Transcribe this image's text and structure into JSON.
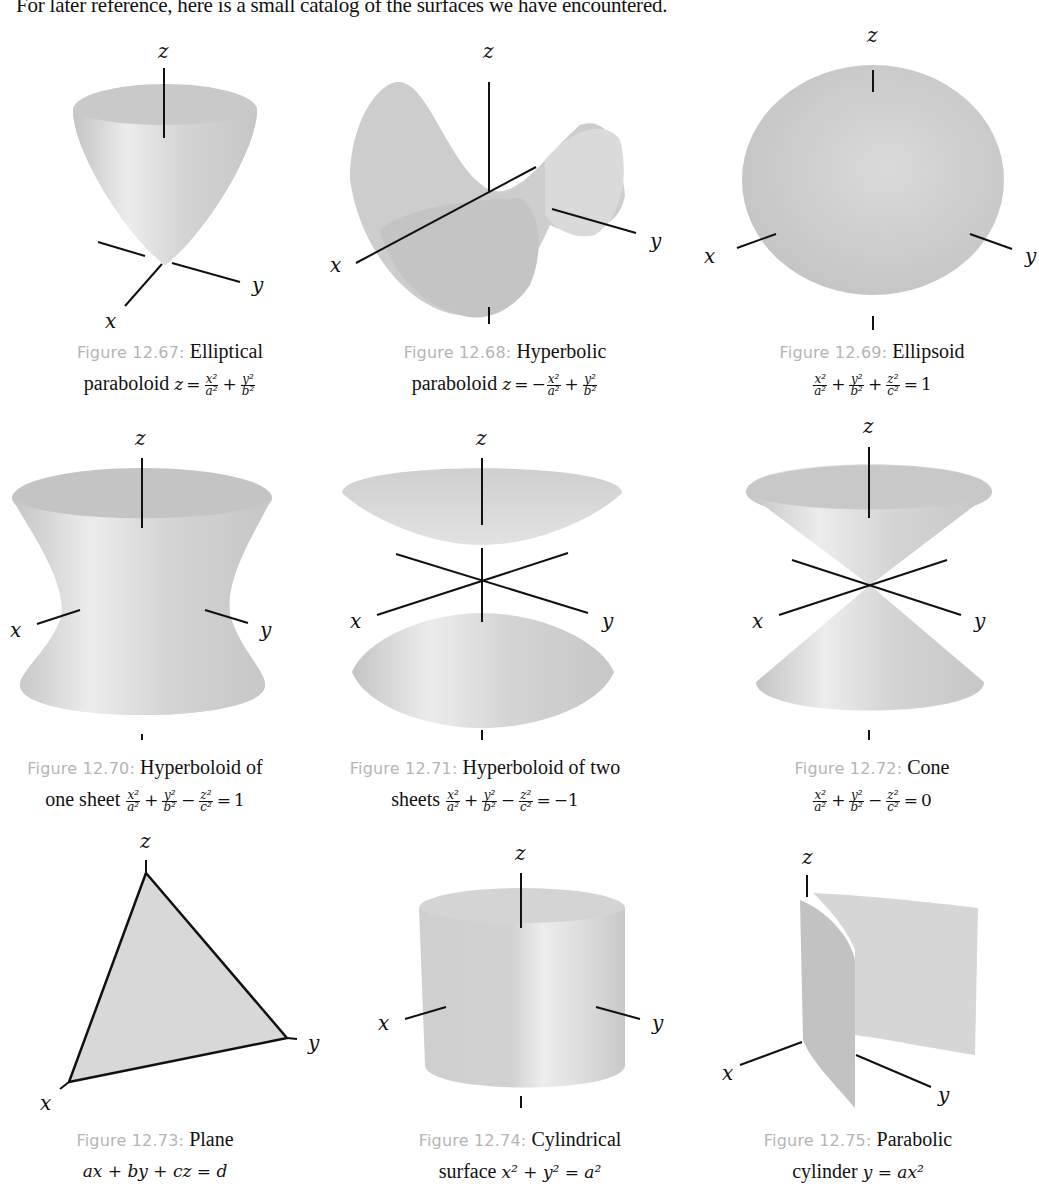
{
  "intro_text": "For later reference, here is a small catalog of the surfaces we have encountered.",
  "axis_labels": {
    "x": "x",
    "y": "y",
    "z": "z"
  },
  "figures": [
    {
      "label": "Figure 12.67:",
      "title": "Elliptical",
      "line2_prefix": "paraboloid",
      "equation": "z = x^2/a^2 + y^2/b^2",
      "eq_parts": {
        "lhs": "z",
        "eq": "=",
        "t1n": "x²",
        "t1d": "a²",
        "op1": "+",
        "t2n": "y²",
        "t2d": "b²"
      }
    },
    {
      "label": "Figure 12.68:",
      "title": "Hyperbolic",
      "line2_prefix": "paraboloid",
      "equation": "z = -x^2/a^2 + y^2/b^2",
      "eq_parts": {
        "lhs": "z",
        "eq": "=",
        "neg": "−",
        "t1n": "x²",
        "t1d": "a²",
        "op1": "+",
        "t2n": "y²",
        "t2d": "b²"
      }
    },
    {
      "label": "Figure 12.69:",
      "title": "Ellipsoid",
      "line2_prefix": "",
      "equation": "x^2/a^2 + y^2/b^2 + z^2/c^2 = 1",
      "eq_parts": {
        "t1n": "x²",
        "t1d": "a²",
        "op1": "+",
        "t2n": "y²",
        "t2d": "b²",
        "op2": "+",
        "t3n": "z²",
        "t3d": "c²",
        "eq": "=",
        "rhs": "1"
      }
    },
    {
      "label": "Figure 12.70:",
      "title": "Hyperboloid of",
      "line2_prefix": "one sheet",
      "equation": "x^2/a^2 + y^2/b^2 - z^2/c^2 = 1",
      "eq_parts": {
        "t1n": "x²",
        "t1d": "a²",
        "op1": "+",
        "t2n": "y²",
        "t2d": "b²",
        "op2": "−",
        "t3n": "z²",
        "t3d": "c²",
        "eq": "=",
        "rhs": "1"
      }
    },
    {
      "label": "Figure 12.71:",
      "title": "Hyperboloid of two",
      "line2_prefix": "sheets",
      "equation": "x^2/a^2 + y^2/b^2 - z^2/c^2 = -1",
      "eq_parts": {
        "t1n": "x²",
        "t1d": "a²",
        "op1": "+",
        "t2n": "y²",
        "t2d": "b²",
        "op2": "−",
        "t3n": "z²",
        "t3d": "c²",
        "eq": "=",
        "rhs": "−1"
      }
    },
    {
      "label": "Figure 12.72:",
      "title": "Cone",
      "line2_prefix": "",
      "equation": "x^2/a^2 + y^2/b^2 - z^2/c^2 = 0",
      "eq_parts": {
        "t1n": "x²",
        "t1d": "a²",
        "op1": "+",
        "t2n": "y²",
        "t2d": "b²",
        "op2": "−",
        "t3n": "z²",
        "t3d": "c²",
        "eq": "=",
        "rhs": "0"
      }
    },
    {
      "label": "Figure 12.73:",
      "title": "Plane",
      "line2_prefix": "",
      "equation": "ax + by + cz = d",
      "eq_text": "ax + by + cz = d"
    },
    {
      "label": "Figure 12.74:",
      "title": "Cylindrical",
      "line2_prefix": "surface",
      "equation": "x^2 + y^2 = a^2",
      "eq_text": "x² + y² = a²"
    },
    {
      "label": "Figure 12.75:",
      "title": "Parabolic",
      "line2_prefix": "cylinder",
      "equation": "y = ax^2",
      "eq_text": "y = ax²"
    }
  ],
  "colors": {
    "surface_light": "#e4e4e4",
    "surface_dark": "#bdbdbd",
    "axis": "#111111",
    "figure_label": "#b5b5b5"
  }
}
